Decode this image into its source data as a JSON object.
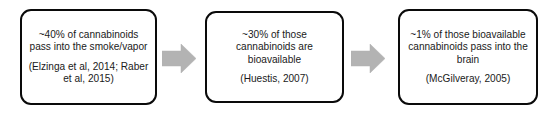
{
  "diagram": {
    "background_color": "#ffffff",
    "box_border_color": "#0a0a0a",
    "arrow_color": "#b3b3b3",
    "text_color": "#1a1a1a",
    "steps": [
      {
        "id": "step-1",
        "statement": "~40% of cannabinoids pass into the smoke/vapor",
        "citation": "(Elzinga et al, 2014; Raber et al, 2015)"
      },
      {
        "id": "step-2",
        "statement": "~30% of those cannabinoids are bioavailable",
        "citation": "(Huestis, 2007)"
      },
      {
        "id": "step-3",
        "statement": "~1% of those bioavailable cannabinoids pass into the brain",
        "citation": "(McGilveray, 2005)"
      }
    ],
    "connectors": [
      {
        "id": "connector-1",
        "icon": "right-arrow-icon",
        "from": "step-1",
        "to": "step-2"
      },
      {
        "id": "connector-2",
        "icon": "right-arrow-icon",
        "from": "step-2",
        "to": "step-3"
      }
    ]
  }
}
